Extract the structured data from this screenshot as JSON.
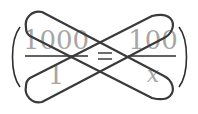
{
  "diagram": {
    "type": "cross-multiplication",
    "equation": {
      "left_fraction": {
        "numerator": "1000",
        "denominator": "1"
      },
      "operator": "=",
      "right_fraction": {
        "numerator": "100",
        "denominator": "x"
      }
    },
    "loops": [
      {
        "name": "loop-left-num-to-right-den",
        "connects": [
          "1000",
          "x"
        ]
      },
      {
        "name": "loop-left-den-to-right-num",
        "connects": [
          "1",
          "100"
        ]
      }
    ],
    "colors": {
      "text": "#a6a6a6",
      "lines": "#3a3a3a"
    }
  }
}
